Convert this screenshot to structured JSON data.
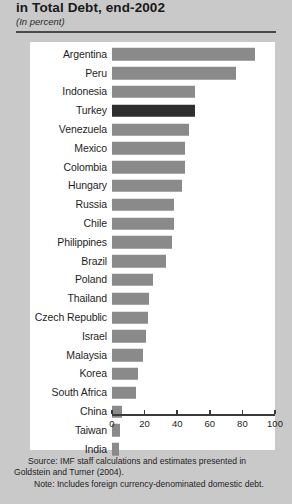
{
  "header": {
    "title": "in Total Debt, end-2002",
    "subtitle": "(In percent)"
  },
  "footnotes": {
    "source": "Source: IMF staff calculations and estimates presented in Goldstein and Turner (2004).",
    "note": "Note: Includes foreign currency-denominated domestic debt."
  },
  "colors": {
    "bar": "#8a8a8a",
    "highlight": "#2e2e2e",
    "page_background": "#c9c9c9",
    "panel_background": "#ffffff",
    "axis": "#3a3a3a"
  },
  "chart_data": {
    "type": "bar",
    "orientation": "horizontal",
    "title": "in Total Debt, end-2002",
    "subtitle": "(In percent)",
    "xlabel": "",
    "ylabel": "",
    "xlim": [
      0,
      100
    ],
    "xticks": [
      0,
      20,
      40,
      60,
      80,
      100
    ],
    "grid": false,
    "legend": false,
    "highlight_category": "Turkey",
    "categories": [
      "Argentina",
      "Peru",
      "Indonesia",
      "Turkey",
      "Venezuela",
      "Mexico",
      "Colombia",
      "Hungary",
      "Russia",
      "Chile",
      "Philippines",
      "Brazil",
      "Poland",
      "Thailand",
      "Czech Republic",
      "Israel",
      "Malaysia",
      "Korea",
      "South Africa",
      "China",
      "Taiwan",
      "India"
    ],
    "values": [
      88,
      76,
      51,
      51,
      47,
      45,
      45,
      43,
      38,
      38,
      37,
      33,
      25,
      23,
      22,
      21,
      19,
      16,
      15,
      6,
      5,
      4
    ]
  }
}
